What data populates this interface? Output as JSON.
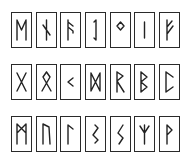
{
  "rows": [
    {
      "tiles": [
        {
          "name": "mannaz",
          "glyph": "ᛗ"
        },
        {
          "name": "nauthiz",
          "glyph": "ᚾ"
        },
        {
          "name": "ansuz",
          "glyph": "ᚨ"
        },
        {
          "name": "eihwaz",
          "glyph": "ᛇ"
        },
        {
          "name": "ingwaz",
          "glyph": "ᛜ"
        },
        {
          "name": "isa",
          "glyph": "ᛁ"
        },
        {
          "name": "fehu",
          "glyph": "ᚠ"
        }
      ]
    },
    {
      "tiles": [
        {
          "name": "gebo",
          "glyph": "ᚷ"
        },
        {
          "name": "othala",
          "glyph": "ᛟ"
        },
        {
          "name": "kenaz",
          "glyph": "ᚲ"
        },
        {
          "name": "dagaz",
          "glyph": "ᛞ"
        },
        {
          "name": "raidho",
          "glyph": "ᚱ"
        },
        {
          "name": "berkano",
          "glyph": "ᛒ"
        },
        {
          "name": "perthro",
          "glyph": "ᛈ"
        }
      ]
    },
    {
      "tiles": [
        {
          "name": "ehwaz",
          "glyph": "ᛖ"
        },
        {
          "name": "uruz",
          "glyph": "ᚢ"
        },
        {
          "name": "laguz",
          "glyph": "ᛚ"
        },
        {
          "name": "sowilo-z",
          "glyph": "ᛊ"
        },
        {
          "name": "sowilo",
          "glyph": "ᛋ"
        },
        {
          "name": "algiz",
          "glyph": "ᛉ"
        },
        {
          "name": "wunjo",
          "glyph": "ᚹ"
        }
      ]
    }
  ],
  "colors": {
    "stroke": "#222222",
    "background": "#ffffff"
  }
}
